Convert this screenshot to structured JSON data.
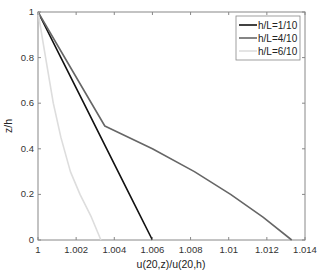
{
  "chart_data": {
    "type": "line",
    "title": "",
    "xlabel": "u(20,z)/u(20,h)",
    "ylabel": "z/h",
    "xlim": [
      1,
      1.014
    ],
    "ylim": [
      0,
      1
    ],
    "xticks": [
      "1",
      "1.002",
      "1.004",
      "1.006",
      "1.008",
      "1.01",
      "1.012",
      "1.014"
    ],
    "yticks": [
      "0",
      "0.2",
      "0.4",
      "0.6",
      "0.8",
      "1"
    ],
    "grid": false,
    "legend_position": "upper right",
    "series": [
      {
        "name": "h/L=1/10",
        "color": "#111111",
        "x": [
          1.006,
          1.0048,
          1.0036,
          1.0024,
          1.0012,
          1.0
        ],
        "y": [
          0,
          0.2,
          0.4,
          0.6,
          0.8,
          1.0
        ]
      },
      {
        "name": "h/L=4/10",
        "color": "#666666",
        "x": [
          1.0133,
          1.0118,
          1.0101,
          1.0082,
          1.006,
          1.0035,
          1.0
        ],
        "y": [
          0,
          0.1,
          0.2,
          0.3,
          0.4,
          0.5,
          1.0
        ]
      },
      {
        "name": "h/L=6/10",
        "color": "#dddddd",
        "x": [
          1.0033,
          1.0028,
          1.0022,
          1.0017,
          1.0012,
          1.0008,
          1.0004,
          1.0
        ],
        "y": [
          0,
          0.1,
          0.2,
          0.3,
          0.45,
          0.6,
          0.8,
          1.0
        ]
      }
    ]
  }
}
